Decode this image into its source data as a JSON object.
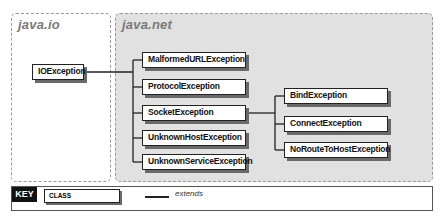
{
  "packages": [
    {
      "name": "java.io"
    },
    {
      "name": "java.net"
    }
  ],
  "classes": {
    "ioexception": "IOException",
    "malformed": "MalformedURLException",
    "protocol": "ProtocolException",
    "socket": "SocketException",
    "unknownhost": "UnknownHostException",
    "unknownservice": "UnknownServiceException",
    "bind": "BindException",
    "connect": "ConnectException",
    "noroute": "NoRouteToHostException"
  },
  "hierarchy": [
    {
      "parent": "IOException",
      "children": [
        "MalformedURLException",
        "ProtocolException",
        "SocketException",
        "UnknownHostException",
        "UnknownServiceException"
      ]
    },
    {
      "parent": "SocketException",
      "children": [
        "BindException",
        "ConnectException",
        "NoRouteToHostException"
      ]
    }
  ],
  "key": {
    "label": "KEY",
    "class_label": "CLASS",
    "extends_label": "extends"
  }
}
